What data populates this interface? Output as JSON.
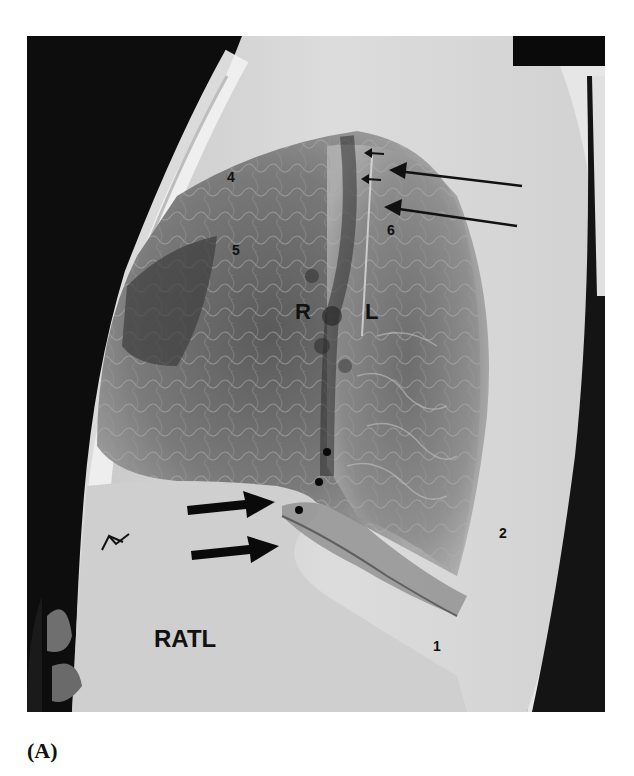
{
  "figure": {
    "caption": "(A)",
    "type": "lateral chest radiograph",
    "labels": {
      "num1": "1",
      "num2": "2",
      "num4": "4",
      "num5": "5",
      "num6": "6",
      "right": "R",
      "left": "L",
      "ratl": "RATL"
    },
    "markers": {
      "long_thin_arrows": 2,
      "small_arrows": 2,
      "thick_black_arrows": 2,
      "open_arrowhead": 1,
      "dots": 3
    }
  }
}
